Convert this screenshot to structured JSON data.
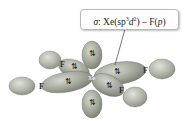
{
  "diagram": {
    "label": {
      "sigma": "σ",
      "text": ": Xe(sp",
      "sup1": "3",
      "mid": "d",
      "sup2": "2",
      "end": ") – F(",
      "p": "p",
      "close": ")"
    },
    "atoms": {
      "center": "Xe",
      "f_upper_left": "F",
      "f_left": "F",
      "f_right": "F",
      "f_lower_right": "F"
    },
    "electron_pair": "⇅",
    "colors": {
      "lobe_fill": "#a7ab9f",
      "lobe_dark": "#7d8277",
      "f_lobe_fill": "#b5b9ae",
      "outline": "#6a6e64",
      "box_border": "#b8b8b8",
      "pointer": "#555555"
    }
  }
}
